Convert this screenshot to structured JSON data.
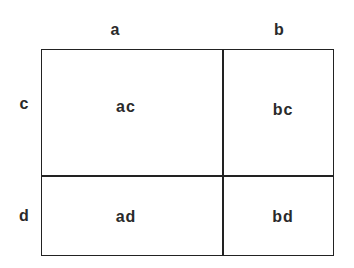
{
  "diagram": {
    "type": "area-model-multiplication",
    "column_labels": [
      "a",
      "b"
    ],
    "row_labels": [
      "c",
      "d"
    ],
    "cells": [
      [
        "ac",
        "bc"
      ],
      [
        "ad",
        "bd"
      ]
    ]
  }
}
